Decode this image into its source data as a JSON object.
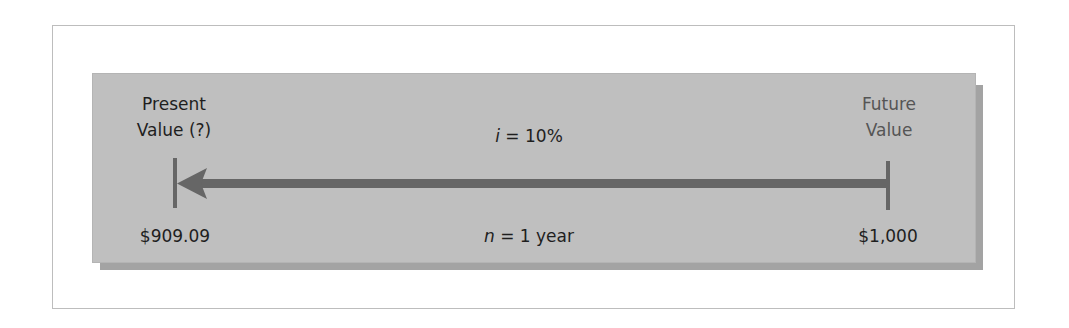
{
  "diagram": {
    "left": {
      "heading_line1": "Present",
      "heading_line2": "Value (?)",
      "amount": "$909.09"
    },
    "right": {
      "heading_line1": "Future",
      "heading_line2": "Value",
      "amount": "$1,000"
    },
    "rate": {
      "symbol": "i",
      "text": " = 10%"
    },
    "period": {
      "symbol": "n",
      "text": " = 1 year"
    },
    "arrow": {
      "direction": "right-to-left",
      "meaning": "discounting"
    },
    "colors": {
      "panel": "#bfbfbf",
      "panel_shadow": "#a3a3a3",
      "arrow": "#666666",
      "text_dark": "#1e1e1e",
      "text_muted": "#555555",
      "frame_border": "#bdbdbd"
    }
  }
}
